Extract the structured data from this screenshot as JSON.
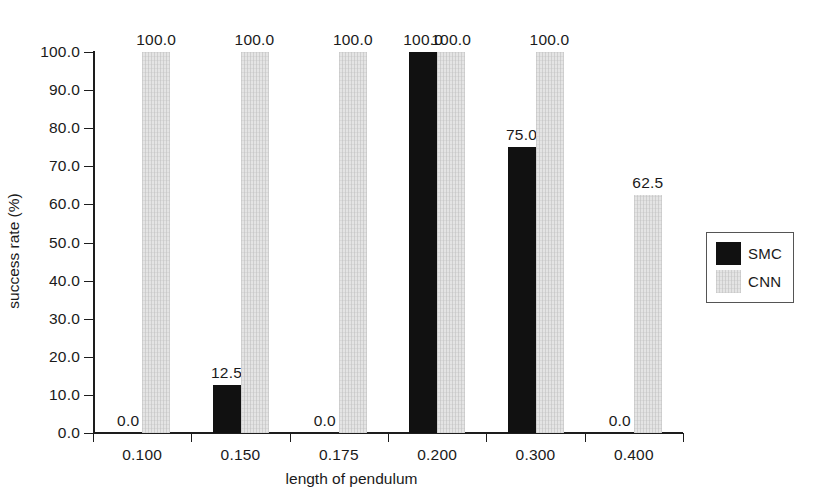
{
  "chart_data": {
    "type": "bar",
    "title": "",
    "subtitle": "",
    "xlabel": "length of pendulum",
    "ylabel": "success rate (%)",
    "categories": [
      "0.100",
      "0.150",
      "0.175",
      "0.200",
      "0.300",
      "0.400"
    ],
    "series": [
      {
        "name": "SMC",
        "color": "#111111",
        "values": [
          0.0,
          12.5,
          0.0,
          100.0,
          75.0,
          0.0
        ],
        "labels": [
          "0.0",
          "12.5",
          "0.0",
          "100.0",
          "75.0",
          "0.0"
        ]
      },
      {
        "name": "CNN",
        "color": "#e4e4e4",
        "values": [
          100.0,
          100.0,
          100.0,
          100.0,
          100.0,
          62.5
        ],
        "labels": [
          "100.0",
          "100.0",
          "100.0",
          "100.0",
          "100.0",
          "62.5"
        ]
      }
    ],
    "ylim": [
      0.0,
      100.0
    ],
    "ytick_values": [
      0.0,
      10.0,
      20.0,
      30.0,
      40.0,
      50.0,
      60.0,
      70.0,
      80.0,
      90.0,
      100.0
    ],
    "ytick_labels": [
      "0.0",
      "10.0",
      "20.0",
      "30.0",
      "40.0",
      "50.0",
      "60.0",
      "70.0",
      "80.0",
      "90.0",
      "100.0"
    ],
    "grid": false,
    "legend_position": "right",
    "legend_entries": [
      "SMC",
      "CNN"
    ]
  }
}
